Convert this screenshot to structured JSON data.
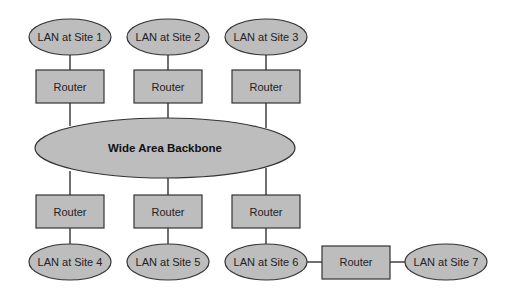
{
  "diagram": {
    "title": "",
    "backbone": {
      "id": "backbone",
      "label": "Wide Area Backbone",
      "shape": "ellipse"
    },
    "lans": [
      {
        "id": "lan1",
        "label": "LAN at Site 1",
        "shape": "ellipse"
      },
      {
        "id": "lan2",
        "label": "LAN at Site 2",
        "shape": "ellipse"
      },
      {
        "id": "lan3",
        "label": "LAN at Site 3",
        "shape": "ellipse"
      },
      {
        "id": "lan4",
        "label": "LAN at Site 4",
        "shape": "ellipse"
      },
      {
        "id": "lan5",
        "label": "LAN at Site 5",
        "shape": "ellipse"
      },
      {
        "id": "lan6",
        "label": "LAN at Site 6",
        "shape": "ellipse"
      },
      {
        "id": "lan7",
        "label": "LAN at Site 7",
        "shape": "ellipse"
      }
    ],
    "routers": [
      {
        "id": "r1",
        "label": "Router",
        "shape": "rectangle"
      },
      {
        "id": "r2",
        "label": "Router",
        "shape": "rectangle"
      },
      {
        "id": "r3",
        "label": "Router",
        "shape": "rectangle"
      },
      {
        "id": "r4",
        "label": "Router",
        "shape": "rectangle"
      },
      {
        "id": "r5",
        "label": "Router",
        "shape": "rectangle"
      },
      {
        "id": "r6",
        "label": "Router",
        "shape": "rectangle"
      },
      {
        "id": "r7",
        "label": "Router",
        "shape": "rectangle"
      }
    ],
    "edges": [
      [
        "lan1",
        "r1"
      ],
      [
        "r1",
        "backbone"
      ],
      [
        "lan2",
        "r2"
      ],
      [
        "r2",
        "backbone"
      ],
      [
        "lan3",
        "r3"
      ],
      [
        "r3",
        "backbone"
      ],
      [
        "backbone",
        "r4"
      ],
      [
        "r4",
        "lan4"
      ],
      [
        "backbone",
        "r5"
      ],
      [
        "r5",
        "lan5"
      ],
      [
        "backbone",
        "r6"
      ],
      [
        "r6",
        "lan6"
      ],
      [
        "lan6",
        "r7"
      ],
      [
        "r7",
        "lan7"
      ]
    ],
    "colors": {
      "fill": "#bdbdbd",
      "stroke": "#333333",
      "text": "#222222"
    }
  }
}
